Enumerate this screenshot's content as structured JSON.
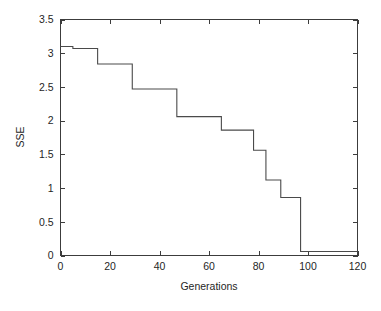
{
  "chart_data": {
    "type": "line",
    "title": "",
    "subtitle": "",
    "xlabel": "Generations",
    "ylabel": "SSE",
    "xlim": [
      0,
      120
    ],
    "ylim": [
      0,
      3.5
    ],
    "xticks": [
      0,
      20,
      40,
      60,
      80,
      100,
      120
    ],
    "xtick_labels": [
      "0",
      "20",
      "40",
      "60",
      "80",
      "100",
      "120"
    ],
    "yticks": [
      0,
      0.5,
      1,
      1.5,
      2,
      2.5,
      3,
      3.5
    ],
    "ytick_labels": [
      "0",
      "0.5",
      "1",
      "1.5",
      "2",
      "2.5",
      "3",
      "3.5"
    ],
    "grid": false,
    "legend": null,
    "legend_position": "none",
    "line_color": "#4a4a4a",
    "frame": "box",
    "tick_direction": "in",
    "annotations": [],
    "series": [
      {
        "name": "SSE",
        "style": "step-post",
        "x": [
          0,
          5,
          15,
          29,
          47,
          65,
          78,
          83,
          89,
          97,
          120
        ],
        "y": [
          3.1,
          3.07,
          2.84,
          2.47,
          2.06,
          1.86,
          1.56,
          1.12,
          0.86,
          0.06,
          0.06
        ],
        "points": [
          {
            "x": 0,
            "y": 3.1
          },
          {
            "x": 5,
            "y": 3.07
          },
          {
            "x": 15,
            "y": 2.84
          },
          {
            "x": 29,
            "y": 2.47
          },
          {
            "x": 47,
            "y": 2.06
          },
          {
            "x": 65,
            "y": 1.86
          },
          {
            "x": 78,
            "y": 1.56
          },
          {
            "x": 83,
            "y": 1.12
          },
          {
            "x": 89,
            "y": 0.86
          },
          {
            "x": 97,
            "y": 0.06
          },
          {
            "x": 120,
            "y": 0.06
          }
        ]
      }
    ]
  },
  "figure": {
    "background_color": "#ffffff",
    "axis_color": "#3c3c3c",
    "text_color": "#1f1f1f"
  }
}
